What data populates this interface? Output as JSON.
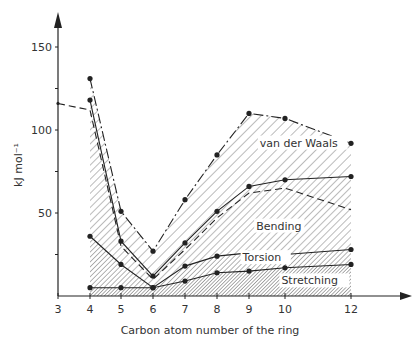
{
  "chart_data": {
    "type": "line",
    "title": "",
    "xlabel": "Carbon atom number of the ring",
    "ylabel": "kJ mol⁻¹",
    "x_ticks": [
      3,
      4,
      5,
      6,
      7,
      8,
      9,
      10,
      12
    ],
    "y_ticks": [
      50,
      100,
      150
    ],
    "xlim": [
      3,
      13
    ],
    "ylim": [
      0,
      165
    ],
    "grid": false,
    "legend_position": "inline labels",
    "series": [
      {
        "name": "van der Waals (total)",
        "style": "dash-dot",
        "markers": true,
        "x": [
          4,
          5,
          6,
          7,
          8,
          9,
          10,
          12
        ],
        "values": [
          131,
          51,
          27,
          58,
          85,
          110,
          107,
          92
        ]
      },
      {
        "name": "Bending upper (solid)",
        "style": "solid",
        "markers": true,
        "x": [
          4,
          5,
          6,
          7,
          8,
          9,
          10,
          12
        ],
        "values": [
          118,
          33,
          12,
          32,
          51,
          66,
          70,
          72
        ]
      },
      {
        "name": "Bending (dashed)",
        "style": "dashed",
        "markers": false,
        "x": [
          3,
          4,
          5,
          6,
          7,
          8,
          9,
          10,
          12
        ],
        "values": [
          116,
          112,
          30,
          10,
          28,
          47,
          62,
          65,
          52
        ]
      },
      {
        "name": "Torsion",
        "style": "solid",
        "markers": true,
        "x": [
          4,
          5,
          6,
          7,
          8,
          9,
          10,
          12
        ],
        "values": [
          36,
          19,
          5,
          18,
          24,
          26,
          25,
          28
        ]
      },
      {
        "name": "Stretching",
        "style": "solid",
        "markers": true,
        "x": [
          4,
          5,
          6,
          7,
          8,
          9,
          10,
          12
        ],
        "values": [
          5,
          5,
          5,
          9,
          14,
          15,
          17,
          19
        ]
      }
    ],
    "annotations": [
      {
        "text": "van der Waals",
        "x": 9.3,
        "y": 90
      },
      {
        "text": "Bending",
        "x": 9.2,
        "y": 40
      },
      {
        "text": "Torsion",
        "x": 8.8,
        "y": 21
      },
      {
        "text": "Stretching",
        "x": 9.9,
        "y": 7
      }
    ]
  }
}
